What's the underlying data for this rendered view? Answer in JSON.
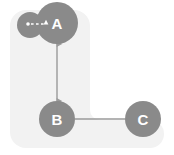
{
  "diagram": {
    "background": {
      "shape": "rounded-l-shape",
      "color": "#f2f2f2"
    },
    "colors": {
      "node_fill": "#8a8a8a",
      "node_label": "#ffffff",
      "edge": "#9a9a9a",
      "self_loop": "#ffffff",
      "panel": "#f2f2f2",
      "canvas": "#ffffff"
    },
    "nodes": [
      {
        "id": "A",
        "label": "A",
        "cx": 57,
        "cy": 23,
        "r": 21,
        "self_loop": true
      },
      {
        "id": "B",
        "label": "B",
        "cx": 57,
        "cy": 119,
        "r": 18,
        "self_loop": false
      },
      {
        "id": "C",
        "label": "C",
        "cx": 143,
        "cy": 119,
        "r": 18,
        "self_loop": false
      }
    ],
    "edges": [
      {
        "id": "A-B",
        "from": "A",
        "to": "B",
        "direction": "bidirectional",
        "style": "solid"
      },
      {
        "id": "B-C",
        "from": "B",
        "to": "C",
        "direction": "none",
        "style": "solid"
      }
    ],
    "self_loops": [
      {
        "id": "A-self",
        "node": "A",
        "direction": "forward",
        "style": "dotted"
      }
    ]
  }
}
